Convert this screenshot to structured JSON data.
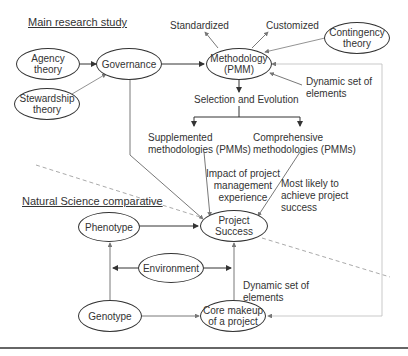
{
  "headings": {
    "main": "Main research study",
    "natural": "Natural Science comparative"
  },
  "nodes": {
    "agency": "Agency\ntheory",
    "stewardship": "Stewardship\ntheory",
    "governance": "Governance",
    "methodology": "Methodology\n(PMM)",
    "contingency": "Contingency\ntheory",
    "project_success": "Project Success",
    "phenotype": "Phenotype",
    "environment": "Environment",
    "genotype": "Genotype",
    "core_makeup": "Core makeup\nof a project"
  },
  "labels": {
    "standardized": "Standardized",
    "customized": "Customized",
    "dynamic_top": "Dynamic set of\nelements",
    "selection": "Selection and Evolution",
    "supplemented": "Supplemented\nmethodologies (PMMs)",
    "comprehensive": "Comprehensive\nmethodologies (PMMs)",
    "impact": "Impact of project\nmanagement\nexperience",
    "most_likely": "Most likely to\nachieve project\nsuccess",
    "dynamic_bottom": "Dynamic set of\nelements"
  },
  "colors": {
    "line": "#333333",
    "dashed_divider": "#aaaaaa",
    "feedback_loop": "#bbbbbb"
  }
}
